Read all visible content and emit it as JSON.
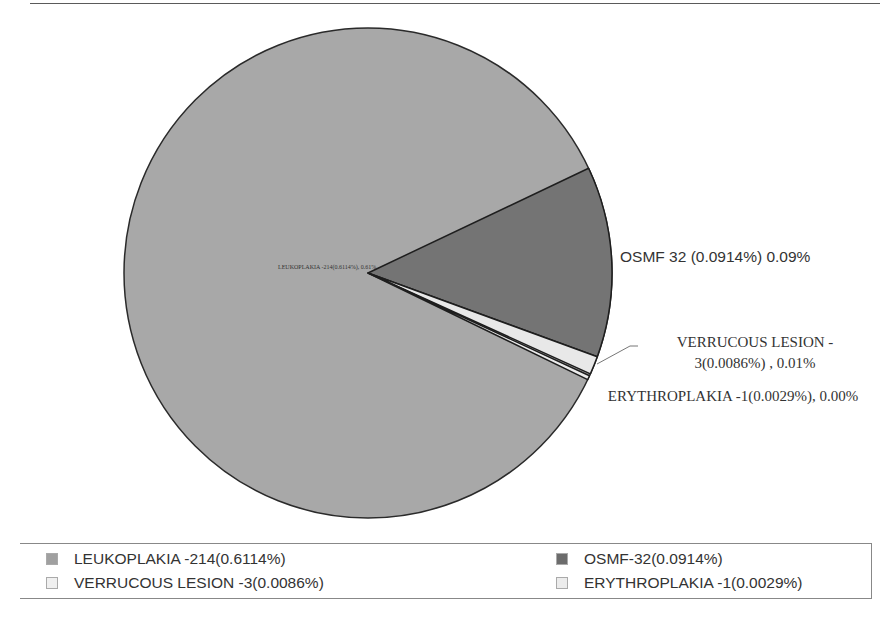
{
  "chart_data": {
    "type": "pie",
    "title": "",
    "slices": [
      {
        "name": "LEUKOPLAKIA",
        "count": 214,
        "percent_label": "0.6114%",
        "color": "#a8a8a8",
        "start_deg": -334.0,
        "end_deg": -25.3
      },
      {
        "name": "OSMF",
        "count": 32,
        "percent_label": "0.0914%",
        "color": "#747474",
        "start_deg": -25.3,
        "end_deg": 20.0
      },
      {
        "name": "VERRUCOUS LESION",
        "count": 3,
        "percent_label": "0.0086%",
        "color": "#e8e8e8",
        "start_deg": 20.0,
        "end_deg": 24.3
      },
      {
        "name": "ERYTHROPLAKIA",
        "count": 1,
        "percent_label": "0.0029%",
        "color": "#ececec",
        "start_deg": 24.8,
        "end_deg": 25.8
      }
    ],
    "categories": [
      "LEUKOPLAKIA",
      "OSMF",
      "VERRUCOUS LESION",
      "ERYTHROPLAKIA"
    ],
    "values": [
      214,
      32,
      3,
      1
    ],
    "legend_position": "bottom"
  },
  "labels": {
    "leukoplakia": "LEUKOPLAKIA -214(0.6114%), 0.61%",
    "osmf": "OSMF 32 (0.0914%) 0.09%",
    "verrucous": "VERRUCOUS LESION - 3(0.0086%) , 0.01%",
    "erythroplakia": "ERYTHROPLAKIA -1(0.0029%), 0.00%"
  },
  "legend": {
    "items": [
      {
        "label": "LEUKOPLAKIA -214(0.6114%)",
        "color": "#a0a0a0"
      },
      {
        "label": "OSMF-32(0.0914%)",
        "color": "#6c6c6c"
      },
      {
        "label": "VERRUCOUS LESION -3(0.0086%)",
        "color": "#f0f0f0"
      },
      {
        "label": "ERYTHROPLAKIA -1(0.0029%)",
        "color": "#ececec"
      }
    ]
  }
}
